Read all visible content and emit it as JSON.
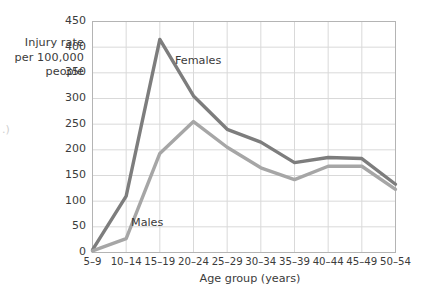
{
  "chart_data": {
    "type": "line",
    "title": "",
    "subtitle": "",
    "xlabel": "Age group (years)",
    "ylabel": "Injury rate per 100,000 people",
    "ylabel_lines": [
      "Injury rate",
      "per 100,000",
      "people"
    ],
    "categories": [
      "5–9",
      "10–14",
      "15–19",
      "20–24",
      "25–29",
      "30–34",
      "35–39",
      "40–44",
      "45–49",
      "50–54"
    ],
    "ylim": [
      0,
      450
    ],
    "yticks": [
      0,
      50,
      100,
      150,
      200,
      250,
      300,
      350,
      400,
      450
    ],
    "ytick_labels": [
      "0",
      "50",
      "100",
      "150",
      "200",
      "250",
      "300",
      "350",
      "400",
      "450"
    ],
    "grid": true,
    "legend_position": "inline-annotations",
    "series": [
      {
        "name": "Females",
        "color": "#7d7d7d",
        "values": [
          5,
          110,
          415,
          305,
          240,
          215,
          175,
          185,
          183,
          133
        ]
      },
      {
        "name": "Males",
        "color": "#a6a6a6",
        "values": [
          3,
          27,
          193,
          255,
          205,
          165,
          142,
          168,
          168,
          123
        ]
      }
    ],
    "annotations": [
      {
        "text": "Females",
        "series": "Females"
      },
      {
        "text": "Males",
        "series": "Males"
      }
    ]
  },
  "style": {
    "plot_border_color": "#b4b4b4",
    "grid_color": "#d9d9d9",
    "text_color": "#3b3b3b",
    "background": "#ffffff",
    "stray_mark": ".)"
  }
}
